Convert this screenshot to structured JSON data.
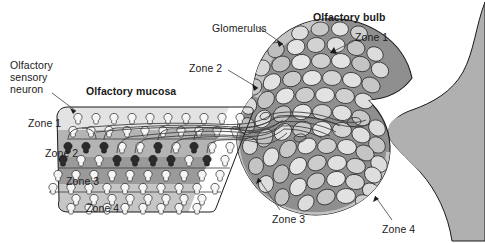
{
  "figure": {
    "title_labels": {
      "olfactory_bulb": "Olfactory bulb",
      "olfactory_mucosa": "Olfactory mucosa",
      "glomerulus": "Glomerulus",
      "olfactory_sensory_neuron_line1": "Olfactory",
      "olfactory_sensory_neuron_line2": "sensory",
      "olfactory_sensory_neuron_line3": "neuron"
    },
    "mucosa_zone_labels": {
      "zone1": "Zone 1",
      "zone2": "Zone 2",
      "zone3": "Zone 3",
      "zone4": "Zone 4"
    },
    "bulb_zone_labels": {
      "zone1": "Zone 1",
      "zone2": "Zone 2",
      "zone3": "Zone 3",
      "zone4": "Zone 4"
    },
    "colors": {
      "background": "#ffffff",
      "outline": "#1a1a1a",
      "text": "#1a1a1a",
      "mucosa_zone1": "#e3e3e3",
      "mucosa_zone2": "#b4b4b4",
      "mucosa_zone3": "#9a9a9a",
      "mucosa_zone4": "#c6c6c6",
      "neuron_light": "#f4f4f4",
      "neuron_dark": "#2b2b2b",
      "bulb_field": "#8f8f8f",
      "bulb_rim": "#bdbdbd",
      "brain_mass": "#b0b0b0",
      "glomerulus_light": "#e8e8e8",
      "glomerulus_mid": "#c0c0c0",
      "glomerulus_dark": "#8a8a8a",
      "axon": "#3a3a3a",
      "leader_line": "#4a4a4a"
    },
    "label_positions": {
      "glomerulus": {
        "x": 212,
        "y": 22
      },
      "olfactory_bulb": {
        "x": 313,
        "y": 11
      },
      "bulb_zone1": {
        "x": 355,
        "y": 31
      },
      "bulb_zone2": {
        "x": 189,
        "y": 62
      },
      "bulb_zone3": {
        "x": 272,
        "y": 213
      },
      "bulb_zone4": {
        "x": 382,
        "y": 223
      },
      "osn": {
        "x": 10,
        "y": 59
      },
      "olfactory_mucosa": {
        "x": 86,
        "y": 85
      },
      "mucosa_zone1": {
        "x": 28,
        "y": 117
      },
      "mucosa_zone2": {
        "x": 45,
        "y": 147
      },
      "mucosa_zone3": {
        "x": 66,
        "y": 175
      },
      "mucosa_zone4": {
        "x": 86,
        "y": 202
      }
    }
  }
}
